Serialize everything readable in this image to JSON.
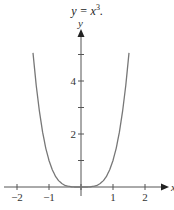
{
  "title": {
    "prefix": "y = x",
    "exponent": "3",
    "suffix": "."
  },
  "chart_data": {
    "type": "line",
    "xlabel": "x",
    "ylabel": "y",
    "xlim": [
      -2.5,
      2.7
    ],
    "ylim": [
      0,
      6
    ],
    "x_ticks": [
      -2,
      -1,
      0,
      1,
      2
    ],
    "x_tick_labels": [
      "−2",
      "−1",
      "1",
      "2"
    ],
    "y_ticks": [
      1,
      2,
      3,
      4,
      5
    ],
    "y_tick_labels": [
      "2",
      "4"
    ],
    "grid": false,
    "legend": null,
    "series": [
      {
        "name": "curve",
        "color": "#777777",
        "x": [
          -1.5,
          -1.4,
          -1.3,
          -1.2,
          -1.1,
          -1.0,
          -0.9,
          -0.8,
          -0.7,
          -0.6,
          -0.5,
          -0.4,
          -0.3,
          -0.2,
          -0.1,
          0.0,
          0.1,
          0.2,
          0.3,
          0.4,
          0.5,
          0.6,
          0.7,
          0.8,
          0.9,
          1.0,
          1.1,
          1.2,
          1.3,
          1.4,
          1.5
        ],
        "y": [
          5.06,
          3.84,
          2.86,
          2.07,
          1.46,
          1.0,
          0.66,
          0.41,
          0.24,
          0.13,
          0.06,
          0.03,
          0.01,
          0.0,
          0.0,
          0.0,
          0.0,
          0.0,
          0.01,
          0.03,
          0.06,
          0.13,
          0.24,
          0.41,
          0.66,
          1.0,
          1.46,
          2.07,
          2.86,
          3.84,
          5.06
        ]
      }
    ]
  },
  "plot": {
    "origin_px": [
      81,
      187
    ],
    "x_unit_px": 32,
    "y_unit_px": 26.5,
    "axis_color": "#555555",
    "curve_color": "#777777"
  }
}
